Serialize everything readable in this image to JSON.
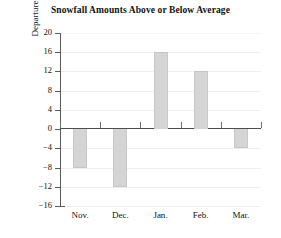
{
  "chart_data": {
    "type": "bar",
    "title": "Snowfall Amounts Above or Below Average",
    "xlabel": "",
    "ylabel": "Departure from Average (in.)",
    "categories": [
      "Nov.",
      "Dec.",
      "Jan.",
      "Feb.",
      "Mar."
    ],
    "values": [
      -8,
      -12,
      16,
      12,
      -4
    ],
    "series": [
      {
        "name": "Departure from Average (in.)",
        "values": [
          -8,
          -12,
          16,
          12,
          -4
        ]
      }
    ],
    "ylim": [
      -16,
      20
    ],
    "ytick_step": 4,
    "ytick_labels": [
      "20",
      "16",
      "12",
      "8",
      "4",
      "0",
      "−4",
      "−8",
      "−12",
      "−16"
    ],
    "ytick_values": [
      20,
      16,
      12,
      8,
      4,
      0,
      -4,
      -8,
      -12,
      -16
    ],
    "grid": true,
    "grid_axis": "y",
    "legend": false,
    "legend_position": "none",
    "zero_line": 0,
    "bar_color": "#d5d5d5",
    "bar_edge_color": "#c9c9c9",
    "axis_color": "#4d4d4d",
    "grid_color": "#eeeeee",
    "background_color": "#ffffff",
    "text_color": "#111111"
  }
}
